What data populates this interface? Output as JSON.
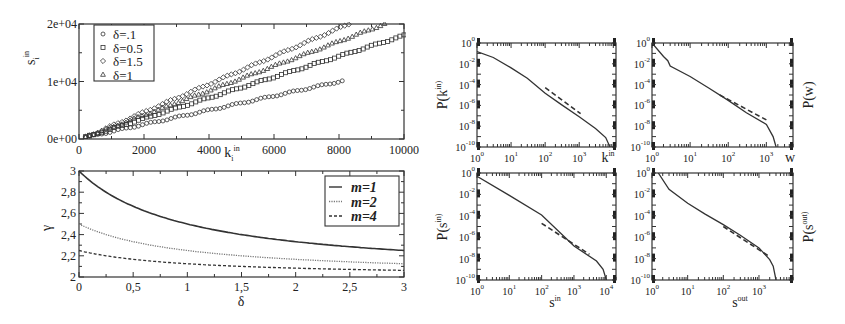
{
  "figure": {
    "panels": [
      "strength-vs-degree",
      "gamma-vs-delta",
      "P-k-in",
      "P-w",
      "P-s-in",
      "P-s-out"
    ]
  },
  "chart_data": [
    {
      "id": "strength-vs-degree",
      "type": "scatter",
      "title": "",
      "xlabel": "k_i^in",
      "ylabel": "s_i^in",
      "xlim": [
        0,
        10000
      ],
      "ylim": [
        0,
        20000
      ],
      "xticks": [
        "0",
        "2000",
        "4000",
        "6000",
        "8000",
        "10000"
      ],
      "yticks": [
        "0e+00",
        "1e+04",
        "2e+04"
      ],
      "legend_position": "upper-left",
      "grid": false,
      "series": [
        {
          "name": "δ=.1",
          "marker": "circle",
          "x": [
            200,
            8100
          ],
          "y": [
            300,
            10100
          ],
          "slope": 1.23
        },
        {
          "name": "δ=0.5",
          "marker": "square",
          "x": [
            200,
            10000
          ],
          "y": [
            300,
            18000
          ],
          "slope": 1.78
        },
        {
          "name": "δ=1.5",
          "marker": "diamond",
          "x": [
            200,
            8300
          ],
          "y": [
            300,
            20000
          ],
          "slope": 2.4
        },
        {
          "name": "δ=1",
          "marker": "triangle",
          "x": [
            200,
            9400
          ],
          "y": [
            300,
            20000
          ],
          "slope": 2.12
        }
      ]
    },
    {
      "id": "gamma-vs-delta",
      "type": "line",
      "title": "",
      "xlabel": "δ",
      "ylabel": "γ",
      "xlim": [
        0,
        3
      ],
      "ylim": [
        2,
        3
      ],
      "xticks": [
        "0",
        "0,5",
        "1",
        "1,5",
        "2",
        "2,5",
        "3"
      ],
      "yticks": [
        "2",
        "2,2",
        "2,4",
        "2,6",
        "2,8",
        "3"
      ],
      "legend_position": "upper-right",
      "grid": false,
      "x": [
        0,
        0.25,
        0.5,
        0.75,
        1.0,
        1.25,
        1.5,
        1.75,
        2.0,
        2.25,
        2.5,
        2.75,
        3.0
      ],
      "series": [
        {
          "name": "m=1",
          "style": "solid",
          "values": [
            3.0,
            2.8,
            2.667,
            2.571,
            2.5,
            2.444,
            2.4,
            2.364,
            2.333,
            2.308,
            2.286,
            2.267,
            2.25
          ]
        },
        {
          "name": "m=2",
          "style": "dotted",
          "values": [
            2.5,
            2.4,
            2.333,
            2.286,
            2.25,
            2.222,
            2.2,
            2.182,
            2.167,
            2.154,
            2.143,
            2.133,
            2.125
          ]
        },
        {
          "name": "m=4",
          "style": "dashed",
          "values": [
            2.25,
            2.2,
            2.167,
            2.143,
            2.125,
            2.111,
            2.1,
            2.091,
            2.083,
            2.077,
            2.071,
            2.067,
            2.0625
          ]
        }
      ]
    },
    {
      "id": "P-k-in",
      "type": "line",
      "scale": "log-log",
      "xlabel": "k^in",
      "ylabel": "P(k^in)",
      "xlim": [
        1,
        10000
      ],
      "ylim": [
        1e-10,
        1
      ],
      "xticks": [
        "10^0",
        "10^1",
        "10^2",
        "10^3"
      ],
      "yticks": [
        "10^-10",
        "10^-8",
        "10^-6",
        "10^-4",
        "10^-2",
        "10^0"
      ],
      "series": [
        {
          "name": "data",
          "style": "solid",
          "x": [
            1,
            3,
            10,
            30,
            100,
            300,
            1000,
            3000,
            6000,
            8000
          ],
          "y": [
            0.15,
            0.04,
            0.004,
            0.0004,
            1.5e-05,
            1.2e-06,
            8e-08,
            6e-09,
            8e-10,
            1e-10
          ]
        },
        {
          "name": "power-law fit",
          "style": "dashed",
          "x": [
            100,
            1100
          ],
          "y": [
            5e-05,
            1.6e-07
          ]
        }
      ]
    },
    {
      "id": "P-w",
      "type": "line",
      "scale": "log-log",
      "xlabel": "w",
      "ylabel": "P(w)",
      "xlim": [
        1,
        3000
      ],
      "ylim": [
        1e-10,
        1
      ],
      "xticks": [
        "10^0",
        "10^1",
        "10^2",
        "10^3"
      ],
      "yticks": [
        "10^-10",
        "10^-8",
        "10^-6",
        "10^-4",
        "10^-2",
        "10^0"
      ],
      "series": [
        {
          "name": "data",
          "style": "solid",
          "x": [
            1,
            2,
            2.6,
            3,
            10,
            30,
            100,
            300,
            1000,
            1500,
            1800
          ],
          "y": [
            1,
            0.05,
            0.02,
            0.006,
            0.0006,
            5e-05,
            3e-06,
            2e-07,
            1.5e-08,
            1e-09,
            1e-10
          ]
        },
        {
          "name": "power-law fit",
          "style": "dashed",
          "x": [
            60,
            1000
          ],
          "y": [
            1e-05,
            4e-08
          ]
        }
      ]
    },
    {
      "id": "P-s-in",
      "type": "line",
      "scale": "log-log",
      "xlabel": "s^in",
      "ylabel": "P(s^in)",
      "xlim": [
        1,
        20000
      ],
      "ylim": [
        1e-10,
        1
      ],
      "xticks": [
        "10^0",
        "10^1",
        "10^2",
        "10^3",
        "10^4"
      ],
      "yticks": [
        "10^-10",
        "10^-8",
        "10^-6",
        "10^-4",
        "10^-2",
        "10^0"
      ],
      "series": [
        {
          "name": "data",
          "style": "solid",
          "x": [
            1,
            10,
            100,
            1000,
            5000,
            8000,
            10000
          ],
          "y": [
            0.5,
            0.008,
            0.00012,
            1.5e-07,
            6e-09,
            1e-09,
            1e-10
          ]
        },
        {
          "name": "power-law fit",
          "style": "dashed",
          "x": [
            100,
            3000
          ],
          "y": [
            2e-05,
            2.5e-08
          ]
        }
      ]
    },
    {
      "id": "P-s-out",
      "type": "line",
      "scale": "log-log",
      "xlabel": "s^out",
      "ylabel": "P(s^out)",
      "xlim": [
        1,
        10000
      ],
      "ylim": [
        1e-10,
        1
      ],
      "xticks": [
        "10^0",
        "10^1",
        "10^2",
        "10^3"
      ],
      "yticks": [
        "10^-10",
        "10^-8",
        "10^-6",
        "10^-4",
        "10^-2",
        "10^0"
      ],
      "series": [
        {
          "name": "data",
          "style": "solid",
          "x": [
            1.5,
            3,
            10,
            30,
            100,
            300,
            1000,
            2000,
            2500,
            3000
          ],
          "y": [
            1,
            0.03,
            0.0015,
            0.00015,
            1.5e-05,
            1.5e-06,
            1e-07,
            8e-09,
            2e-09,
            1e-10
          ]
        },
        {
          "name": "power-law fit",
          "style": "dashed",
          "x": [
            100,
            2000
          ],
          "y": [
            1e-05,
            1.5e-08
          ]
        }
      ]
    }
  ]
}
